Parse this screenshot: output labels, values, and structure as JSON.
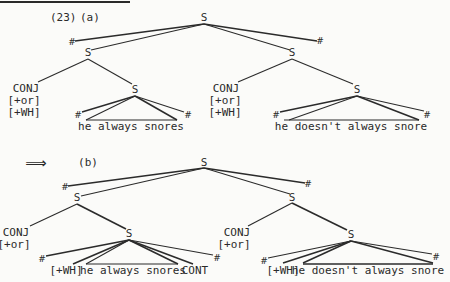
{
  "example_number": "(23)",
  "arrow": "⟹",
  "tree_a": {
    "label": "(a)",
    "root": "S",
    "boundary": "#",
    "left_clause": {
      "node": "S",
      "conj": "CONJ",
      "features": [
        "[+or]",
        "[+WH]"
      ],
      "inner_node": "S",
      "terminal": "he always snores"
    },
    "right_clause": {
      "node": "S",
      "conj": "CONJ",
      "features": [
        "[+or]",
        "[+WH]"
      ],
      "inner_node": "S",
      "terminal": "he doesn't always snore"
    }
  },
  "tree_b": {
    "label": "(b)",
    "root": "S",
    "boundary": "#",
    "left_clause": {
      "node": "S",
      "conj": "CONJ",
      "features": [
        "[+or]"
      ],
      "inner_node": "S",
      "wh": "[+WH]",
      "terminal": "he always snores",
      "cont": "CONT"
    },
    "right_clause": {
      "node": "S",
      "conj": "CONJ",
      "features": [
        "[+or]"
      ],
      "inner_node": "S",
      "wh": "[+WH]",
      "terminal": "he doesn't always snore"
    }
  }
}
